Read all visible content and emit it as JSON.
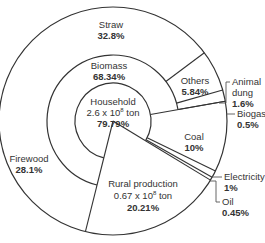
{
  "chart_data": {
    "type": "pie",
    "subtype": "multi-level sunburst",
    "title": "",
    "start_angle_deg": 104,
    "direction": "clockwise",
    "levels": [
      {
        "name": "inner",
        "slices": [
          {
            "label": "Household",
            "detail": "2.6 x 10⁸ ton",
            "value": 79.79,
            "value_label": "79.79%"
          },
          {
            "label": "Rural production",
            "detail": "0.67 x 10⁸ ton",
            "value": 20.21,
            "value_label": "20.21%"
          }
        ]
      },
      {
        "name": "middle",
        "slices": [
          {
            "label": "Biomass",
            "value": 68.34,
            "value_label": "68.34%",
            "parent": "Household"
          },
          {
            "label": "Coal",
            "value": 10,
            "value_label": "10%",
            "parent": "Household"
          },
          {
            "label": "Electricity",
            "value": 1,
            "value_label": "1%",
            "parent": "Household"
          },
          {
            "label": "Oil",
            "value": 0.45,
            "value_label": "0.45%",
            "parent": "Household"
          }
        ]
      },
      {
        "name": "outer",
        "slices": [
          {
            "label": "Firewood",
            "value": 28.1,
            "value_label": "28.1%",
            "parent": "Biomass"
          },
          {
            "label": "Straw",
            "value": 32.8,
            "value_label": "32.8%",
            "parent": "Biomass"
          },
          {
            "label": "Others",
            "value": 5.84,
            "value_label": "5.84%",
            "parent": "Biomass"
          },
          {
            "label": "Animal dung",
            "value": 1.6,
            "value_label": "1.6%",
            "parent": "Biomass"
          },
          {
            "label": "Biogas",
            "value": 0.5,
            "value_label": "0.5%",
            "parent": "Biomass"
          }
        ]
      }
    ]
  },
  "labels": {
    "household": {
      "name": "Household",
      "detail_base": "2.6 x 10",
      "detail_exp": "8",
      "detail_unit": " ton",
      "pct": "79.79%"
    },
    "rural": {
      "name": "Rural production",
      "detail_base": "0.67 x 10",
      "detail_exp": "8",
      "detail_unit": " ton",
      "pct": "20.21%"
    },
    "biomass": {
      "name": "Biomass",
      "pct": "68.34%"
    },
    "straw": {
      "name": "Straw",
      "pct": "32.8%"
    },
    "firewood": {
      "name": "Firewood",
      "pct": "28.1%"
    },
    "others": {
      "name": "Others",
      "pct": "5.84%"
    },
    "animal_dung": {
      "name1": "Animal",
      "name2": "dung",
      "pct": "1.6%"
    },
    "biogas": {
      "name": "Biogas",
      "pct": "0.5%"
    },
    "coal": {
      "name": "Coal",
      "pct": "10%"
    },
    "electricity": {
      "name": "Electricity",
      "pct": "1%"
    },
    "oil": {
      "name": "Oil",
      "pct": "0.45%"
    }
  }
}
